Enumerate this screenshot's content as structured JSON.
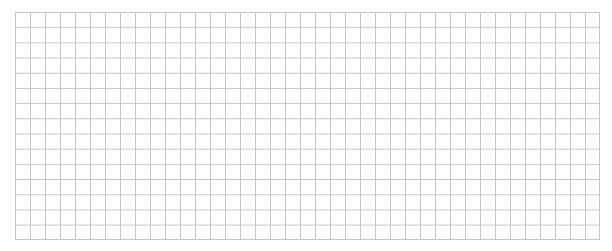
{
  "grid": {
    "columns": 39,
    "rows": 15,
    "line_color": "#c4c4c4",
    "background_color": "#ffffff"
  }
}
